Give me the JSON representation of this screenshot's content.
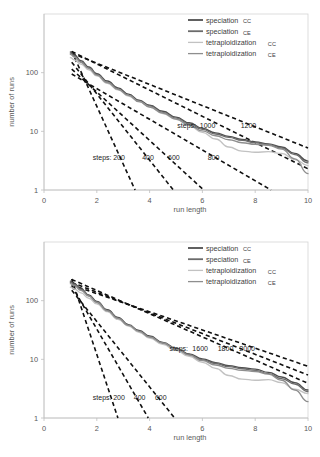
{
  "figure": {
    "panels": [
      "top",
      "bottom"
    ]
  },
  "chart_data": [
    {
      "panel": "top",
      "type": "line",
      "title": "",
      "xlabel": "run length",
      "ylabel": "number of runs",
      "xlim": [
        0,
        10
      ],
      "ylim": [
        1,
        1000
      ],
      "yscale": "log",
      "xscale": "linear",
      "grid": false,
      "xticks": [
        "0",
        "2",
        "4",
        "6",
        "8",
        "10"
      ],
      "xtick_values": [
        0,
        2,
        4,
        6,
        8,
        10
      ],
      "yticks": [
        "1",
        "10",
        "100"
      ],
      "ytick_values": [
        1,
        10,
        100
      ],
      "legend_position": "top-right",
      "series": [
        {
          "name": "speciation",
          "subscript": "CC",
          "color": "#4f4f4f",
          "x": [
            1.0,
            1.15,
            1.4,
            1.7,
            2.0,
            2.4,
            2.8,
            3.2,
            3.6,
            4.0,
            4.5,
            5.0,
            5.5,
            6.0,
            6.5,
            7.0,
            7.5,
            8.0,
            8.5,
            9.0,
            9.5,
            10.0
          ],
          "y": [
            225,
            200,
            160,
            125,
            96,
            72,
            55,
            43,
            34,
            28,
            22,
            17.5,
            14,
            11.2,
            9.4,
            8.2,
            7.3,
            6.6,
            6.1,
            5.4,
            4.2,
            3.1
          ]
        },
        {
          "name": "speciation",
          "subscript": "CE",
          "color": "#6b6b6b",
          "x": [
            1.0,
            1.15,
            1.4,
            1.7,
            2.0,
            2.4,
            2.8,
            3.2,
            3.6,
            4.0,
            4.5,
            5.0,
            5.5,
            6.0,
            6.5,
            7.0,
            7.5,
            8.0,
            8.5,
            9.0,
            9.5,
            10.0
          ],
          "y": [
            215,
            190,
            152,
            120,
            92,
            69,
            53,
            41,
            33,
            27,
            21,
            16.8,
            13.4,
            10.8,
            9.0,
            7.9,
            7.0,
            6.4,
            5.9,
            5.2,
            4.0,
            2.9
          ]
        },
        {
          "name": "tetraploidization",
          "subscript": "CC",
          "color": "#c2c2c2",
          "x": [
            1.0,
            1.15,
            1.4,
            1.7,
            2.0,
            2.4,
            2.8,
            3.2,
            3.6,
            4.0,
            4.5,
            5.0,
            5.5,
            6.0,
            6.5,
            7.0,
            7.5,
            8.0,
            8.5,
            9.0,
            9.5,
            10.0
          ],
          "y": [
            180,
            165,
            140,
            112,
            88,
            66,
            51,
            40,
            32,
            26,
            20,
            16.0,
            12.5,
            9.6,
            7.4,
            5.4,
            4.6,
            4.4,
            4.5,
            4.2,
            3.3,
            2.6
          ]
        },
        {
          "name": "tetraploidization",
          "subscript": "CE",
          "color": "#8e8e8e",
          "x": [
            1.0,
            1.15,
            1.4,
            1.7,
            2.0,
            2.4,
            2.8,
            3.2,
            3.6,
            4.0,
            4.5,
            5.0,
            5.5,
            6.0,
            6.5,
            7.0,
            7.5,
            8.0,
            8.5,
            9.0,
            9.5,
            10.0
          ],
          "y": [
            205,
            185,
            150,
            118,
            91,
            68,
            52,
            41,
            32,
            26,
            20.5,
            16.2,
            12.8,
            10.2,
            8.4,
            7.2,
            6.4,
            6.0,
            5.8,
            5.0,
            3.4,
            1.9
          ]
        }
      ],
      "reference_lines": [
        {
          "label": "200",
          "x": [
            1.05,
            3.45
          ],
          "y": [
            230,
            1.0
          ]
        },
        {
          "label": "400",
          "x": [
            1.05,
            4.9
          ],
          "y": [
            150,
            1.0
          ]
        },
        {
          "label": "600",
          "x": [
            1.05,
            6.05
          ],
          "y": [
            115,
            1.0
          ]
        },
        {
          "label": "800",
          "x": [
            1.05,
            8.6
          ],
          "y": [
            95,
            1.0
          ]
        },
        {
          "label": "1000",
          "x": [
            1.05,
            10.0
          ],
          "y": [
            230,
            2.3
          ]
        },
        {
          "label": "1200",
          "x": [
            1.05,
            10.0
          ],
          "y": [
            215,
            5.2
          ]
        }
      ],
      "annotations": [
        {
          "text": "steps:",
          "x": 1.85,
          "y": 3.3
        },
        {
          "text": "200",
          "x": 2.62,
          "y": 3.3
        },
        {
          "text": "400",
          "x": 3.72,
          "y": 3.3
        },
        {
          "text": "600",
          "x": 4.7,
          "y": 3.3
        },
        {
          "text": "800",
          "x": 6.2,
          "y": 3.3
        },
        {
          "text": "steps:",
          "x": 5.05,
          "y": 11.6
        },
        {
          "text": "1000",
          "x": 5.9,
          "y": 11.6
        },
        {
          "text": "1200",
          "x": 7.45,
          "y": 11.6
        }
      ]
    },
    {
      "panel": "bottom",
      "type": "line",
      "title": "",
      "xlabel": "run length",
      "ylabel": "number of runs",
      "xlim": [
        0,
        10
      ],
      "ylim": [
        1,
        1000
      ],
      "yscale": "log",
      "xscale": "linear",
      "grid": false,
      "xticks": [
        "0",
        "2",
        "4",
        "6",
        "8",
        "10"
      ],
      "xtick_values": [
        0,
        2,
        4,
        6,
        8,
        10
      ],
      "yticks": [
        "1",
        "10",
        "100"
      ],
      "ytick_values": [
        1,
        10,
        100
      ],
      "legend_position": "top-right",
      "series": [
        {
          "name": "speciation",
          "subscript": "CC",
          "color": "#4f4f4f",
          "x": [
            1.0,
            1.15,
            1.4,
            1.7,
            2.0,
            2.4,
            2.8,
            3.2,
            3.6,
            4.0,
            4.5,
            5.0,
            5.5,
            6.0,
            6.5,
            7.0,
            7.5,
            8.0,
            8.5,
            9.0,
            9.5,
            10.0
          ],
          "y": [
            215,
            195,
            160,
            125,
            97,
            70,
            52,
            39,
            31,
            25,
            19.5,
            15.5,
            12.4,
            10.2,
            8.8,
            7.8,
            7.2,
            6.8,
            6.0,
            5.0,
            4.0,
            3.0
          ]
        },
        {
          "name": "speciation",
          "subscript": "CE",
          "color": "#6b6b6b",
          "x": [
            1.0,
            1.15,
            1.4,
            1.7,
            2.0,
            2.4,
            2.8,
            3.2,
            3.6,
            4.0,
            4.5,
            5.0,
            5.5,
            6.0,
            6.5,
            7.0,
            7.5,
            8.0,
            8.5,
            9.0,
            9.5,
            10.0
          ],
          "y": [
            205,
            186,
            154,
            121,
            94,
            68,
            50,
            38,
            30,
            24,
            18.8,
            15.0,
            12.0,
            9.8,
            8.5,
            7.5,
            6.9,
            6.5,
            5.7,
            4.7,
            3.8,
            2.8
          ]
        },
        {
          "name": "tetraploidization",
          "subscript": "CC",
          "color": "#c2c2c2",
          "x": [
            1.0,
            1.15,
            1.4,
            1.7,
            2.0,
            2.4,
            2.8,
            3.2,
            3.6,
            4.0,
            4.5,
            5.0,
            5.5,
            6.0,
            6.5,
            7.0,
            7.5,
            8.0,
            8.5,
            9.0,
            9.5,
            10.0
          ],
          "y": [
            170,
            158,
            136,
            110,
            88,
            65,
            48,
            37,
            29,
            23,
            18.0,
            14.2,
            11.2,
            8.9,
            7.0,
            5.3,
            4.6,
            4.4,
            4.5,
            4.0,
            3.1,
            2.6
          ]
        },
        {
          "name": "tetraploidization",
          "subscript": "CE",
          "color": "#8e8e8e",
          "x": [
            1.0,
            1.15,
            1.4,
            1.7,
            2.0,
            2.4,
            2.8,
            3.2,
            3.6,
            4.0,
            4.5,
            5.0,
            5.5,
            6.0,
            6.5,
            7.0,
            7.5,
            8.0,
            8.5,
            9.0,
            9.5,
            10.0
          ],
          "y": [
            195,
            180,
            150,
            120,
            93,
            67,
            50,
            38,
            30,
            24,
            19.0,
            15.0,
            11.8,
            9.5,
            8.0,
            7.0,
            6.5,
            6.2,
            5.6,
            4.4,
            3.0,
            1.9
          ]
        }
      ],
      "reference_lines": [
        {
          "label": "200",
          "x": [
            1.05,
            2.8
          ],
          "y": [
            235,
            1.0
          ]
        },
        {
          "label": "400",
          "x": [
            1.05,
            3.95
          ],
          "y": [
            180,
            1.0
          ]
        },
        {
          "label": "600",
          "x": [
            1.05,
            4.95
          ],
          "y": [
            150,
            1.0
          ]
        },
        {
          "label": "1600",
          "x": [
            1.05,
            10.0
          ],
          "y": [
            230,
            3.9
          ]
        },
        {
          "label": "1800",
          "x": [
            1.05,
            10.0
          ],
          "y": [
            205,
            5.4
          ]
        },
        {
          "label": "2000",
          "x": [
            1.05,
            10.0
          ],
          "y": [
            185,
            7.6
          ]
        }
      ],
      "annotations": [
        {
          "text": "steps:",
          "x": 1.85,
          "y": 2.0
        },
        {
          "text": "200",
          "x": 2.62,
          "y": 2.0
        },
        {
          "text": "400",
          "x": 3.4,
          "y": 2.0
        },
        {
          "text": "600",
          "x": 4.2,
          "y": 2.0
        },
        {
          "text": "steps:",
          "x": 4.75,
          "y": 14.0
        },
        {
          "text": "1600",
          "x": 5.62,
          "y": 14.0
        },
        {
          "text": "1800",
          "x": 6.58,
          "y": 14.0
        },
        {
          "text": "2000",
          "x": 7.4,
          "y": 14.0
        }
      ]
    }
  ]
}
